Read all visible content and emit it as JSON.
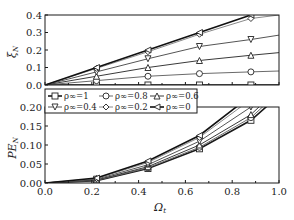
{
  "chart_data": [
    {
      "type": "line",
      "panel": "upper",
      "title": "",
      "xlabel": "Ω_t",
      "ylabel": "ξ_N",
      "ylim": [
        0.0,
        0.4
      ],
      "xlim": [
        0.0,
        1.0
      ],
      "yticks": [
        "0.0",
        "0.1",
        "0.2",
        "0.3",
        "0.4"
      ],
      "grid": false,
      "x": [
        0.0,
        0.22,
        0.44,
        0.66,
        0.88,
        1.0
      ],
      "series": [
        {
          "name": "ρ∞=1",
          "marker": "square",
          "values": [
            0.0,
            0.0,
            0.0,
            0.0,
            0.0,
            0.0
          ]
        },
        {
          "name": "ρ∞=0.8",
          "marker": "circle",
          "values": [
            0.0,
            0.025,
            0.05,
            0.065,
            0.075,
            0.08
          ]
        },
        {
          "name": "ρ∞=0.6",
          "marker": "triangle-up",
          "values": [
            0.0,
            0.05,
            0.1,
            0.14,
            0.17,
            0.185
          ]
        },
        {
          "name": "ρ∞=0.4",
          "marker": "triangle-down",
          "values": [
            0.0,
            0.075,
            0.15,
            0.22,
            0.26,
            0.285
          ]
        },
        {
          "name": "ρ∞=0.2",
          "marker": "diamond",
          "values": [
            0.0,
            0.095,
            0.19,
            0.29,
            0.38,
            0.4
          ]
        },
        {
          "name": "ρ∞=0",
          "marker": "triangle-left",
          "values": [
            0.0,
            0.1,
            0.2,
            0.3,
            0.4,
            0.45
          ]
        }
      ]
    },
    {
      "type": "line",
      "panel": "lower",
      "title": "",
      "xlabel": "Ω_t",
      "ylabel": "PE_N",
      "ylim": [
        0.0,
        0.2
      ],
      "xlim": [
        0.0,
        1.0
      ],
      "xticks": [
        "0.0",
        "0.2",
        "0.4",
        "0.6",
        "0.8",
        "1.0"
      ],
      "yticks": [
        "0.00",
        "0.05",
        "0.10",
        "0.15",
        "0.20"
      ],
      "grid": false,
      "x": [
        0.0,
        0.22,
        0.44,
        0.66,
        0.88,
        1.0
      ],
      "series": [
        {
          "name": "ρ∞=1",
          "marker": "square",
          "values": [
            0.0,
            0.006,
            0.038,
            0.09,
            0.165,
            0.23
          ]
        },
        {
          "name": "ρ∞=0.8",
          "marker": "circle",
          "values": [
            0.0,
            0.007,
            0.04,
            0.094,
            0.172,
            0.24
          ]
        },
        {
          "name": "ρ∞=0.6",
          "marker": "triangle-up",
          "values": [
            0.0,
            0.008,
            0.043,
            0.1,
            0.18,
            0.25
          ]
        },
        {
          "name": "ρ∞=0.4",
          "marker": "triangle-down",
          "values": [
            0.0,
            0.01,
            0.048,
            0.11,
            0.2,
            0.27
          ]
        },
        {
          "name": "ρ∞=0.2",
          "marker": "diamond",
          "values": [
            0.0,
            0.012,
            0.054,
            0.12,
            0.22,
            0.3
          ]
        },
        {
          "name": "ρ∞=0",
          "marker": "triangle-left",
          "values": [
            0.0,
            0.013,
            0.058,
            0.125,
            0.23,
            0.31
          ]
        }
      ]
    }
  ],
  "legend": {
    "entries": [
      "ρ∞=1",
      "ρ∞=0.8",
      "ρ∞=0.6",
      "ρ∞=0.4",
      "ρ∞=0.2",
      "ρ∞=0"
    ],
    "position": "between-panels-top-left"
  },
  "labels": {
    "upper_ylabel": "ξ",
    "upper_ylabel_sub": "N",
    "lower_ylabel": "PE",
    "lower_ylabel_sub": "N",
    "xlabel": "Ω",
    "xlabel_sub": "t"
  },
  "colors": {
    "dark": "#1a1a1a",
    "mid": "#555555",
    "light": "#8a8a8a"
  }
}
